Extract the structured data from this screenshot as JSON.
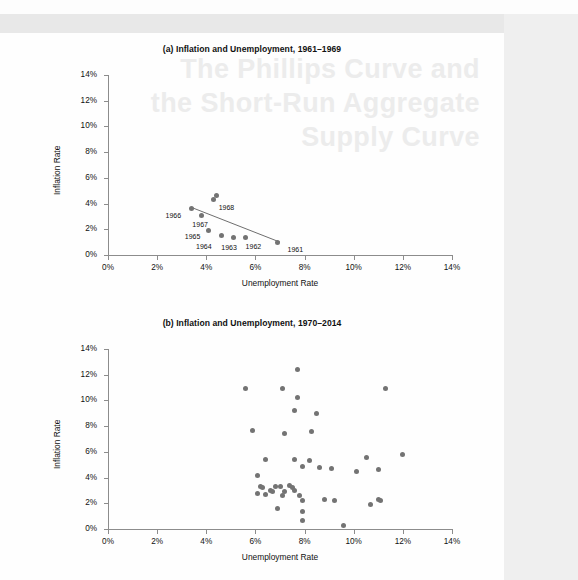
{
  "figure": {
    "background_color": "#fdfdfd",
    "dot_color": "#737373",
    "axis_color": "#8c8c8c",
    "watermark_text": "The Phillips Curve and the Short-Run Aggregate Supply Curve"
  },
  "chart_data": [
    {
      "id": "panel-a",
      "type": "scatter",
      "title": "(a) Inflation and Unemployment, 1961–1969",
      "xlabel": "Unemployment Rate",
      "ylabel": "Inflation Rate",
      "xlim": [
        0,
        14
      ],
      "ylim": [
        0,
        14
      ],
      "xticks": [
        "0%",
        "2%",
        "4%",
        "6%",
        "8%",
        "10%",
        "12%",
        "14%"
      ],
      "yticks": [
        "0%",
        "2%",
        "4%",
        "6%",
        "8%",
        "10%",
        "12%",
        "14%"
      ],
      "xtick_values": [
        0,
        2,
        4,
        6,
        8,
        10,
        12,
        14
      ],
      "ytick_values": [
        0,
        2,
        4,
        6,
        8,
        10,
        12,
        14
      ],
      "grid": false,
      "legend": "none",
      "trendline": {
        "visible": true,
        "x_start": 3.4,
        "y_start": 3.7,
        "x_end": 7.0,
        "y_end": 1.0
      },
      "points": [
        {
          "label": "1961",
          "x": 6.9,
          "y": 1.0
        },
        {
          "label": "1962",
          "x": 5.6,
          "y": 1.4
        },
        {
          "label": "1963",
          "x": 5.1,
          "y": 1.4
        },
        {
          "label": "1964",
          "x": 4.6,
          "y": 1.5
        },
        {
          "label": "1965",
          "x": 4.1,
          "y": 1.9
        },
        {
          "label": "1966",
          "x": 3.4,
          "y": 3.6
        },
        {
          "label": "1967",
          "x": 3.8,
          "y": 3.1
        },
        {
          "label": "1968",
          "x": 4.3,
          "y": 4.3
        },
        {
          "label": "1969",
          "x": 4.4,
          "y": 4.6
        }
      ]
    },
    {
      "id": "panel-b",
      "type": "scatter",
      "title": "(b) Inflation and Unemployment, 1970–2014",
      "xlabel": "Unemployment Rate",
      "ylabel": "Inflation Rate",
      "xlim": [
        0,
        14
      ],
      "ylim": [
        0,
        14
      ],
      "xticks": [
        "0%",
        "2%",
        "4%",
        "6%",
        "8%",
        "10%",
        "12%",
        "14%"
      ],
      "yticks": [
        "0%",
        "2%",
        "4%",
        "6%",
        "8%",
        "10%",
        "12%",
        "14%"
      ],
      "xtick_values": [
        0,
        2,
        4,
        6,
        8,
        10,
        12,
        14
      ],
      "ytick_values": [
        0,
        2,
        4,
        6,
        8,
        10,
        12,
        14
      ],
      "grid": false,
      "legend": "none",
      "trendline": {
        "visible": false
      },
      "points": [
        {
          "x": 7.7,
          "y": 12.4
        },
        {
          "x": 5.6,
          "y": 10.9
        },
        {
          "x": 7.1,
          "y": 10.9
        },
        {
          "x": 11.3,
          "y": 10.9
        },
        {
          "x": 7.7,
          "y": 10.2
        },
        {
          "x": 7.6,
          "y": 9.2
        },
        {
          "x": 8.5,
          "y": 9.0
        },
        {
          "x": 5.9,
          "y": 7.7
        },
        {
          "x": 8.3,
          "y": 7.6
        },
        {
          "x": 7.2,
          "y": 7.4
        },
        {
          "x": 10.5,
          "y": 5.6
        },
        {
          "x": 12.0,
          "y": 5.8
        },
        {
          "x": 6.4,
          "y": 5.4
        },
        {
          "x": 7.6,
          "y": 5.4
        },
        {
          "x": 8.2,
          "y": 5.3
        },
        {
          "x": 7.9,
          "y": 4.9
        },
        {
          "x": 8.6,
          "y": 4.8
        },
        {
          "x": 9.1,
          "y": 4.7
        },
        {
          "x": 10.1,
          "y": 4.5
        },
        {
          "x": 11.0,
          "y": 4.6
        },
        {
          "x": 6.1,
          "y": 4.2
        },
        {
          "x": 6.2,
          "y": 3.3
        },
        {
          "x": 6.3,
          "y": 3.2
        },
        {
          "x": 6.8,
          "y": 3.3
        },
        {
          "x": 7.0,
          "y": 3.3
        },
        {
          "x": 7.4,
          "y": 3.4
        },
        {
          "x": 7.5,
          "y": 3.2
        },
        {
          "x": 6.6,
          "y": 3.0
        },
        {
          "x": 6.7,
          "y": 2.9
        },
        {
          "x": 7.2,
          "y": 2.9
        },
        {
          "x": 7.6,
          "y": 3.0
        },
        {
          "x": 6.1,
          "y": 2.8
        },
        {
          "x": 6.4,
          "y": 2.7
        },
        {
          "x": 7.1,
          "y": 2.6
        },
        {
          "x": 7.8,
          "y": 2.6
        },
        {
          "x": 7.9,
          "y": 2.2
        },
        {
          "x": 8.8,
          "y": 2.3
        },
        {
          "x": 9.2,
          "y": 2.2
        },
        {
          "x": 10.7,
          "y": 1.9
        },
        {
          "x": 11.0,
          "y": 2.3
        },
        {
          "x": 11.1,
          "y": 2.2
        },
        {
          "x": 6.9,
          "y": 1.6
        },
        {
          "x": 7.9,
          "y": 1.4
        },
        {
          "x": 7.9,
          "y": 0.7
        },
        {
          "x": 9.6,
          "y": 0.3
        }
      ]
    }
  ]
}
